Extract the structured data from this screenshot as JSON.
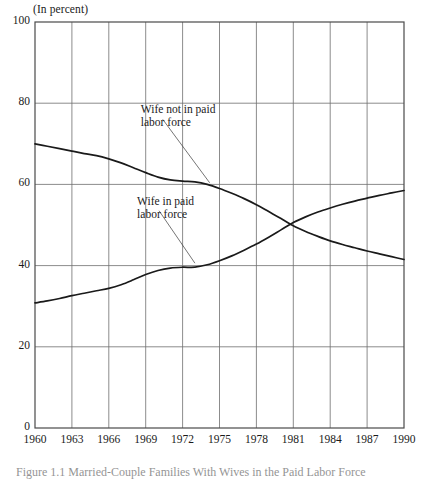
{
  "figure": {
    "unit_label": "(In percent)",
    "caption": "Figure 1.1  Married-Couple Families With Wives in the Paid Labor Force"
  },
  "chart_data": {
    "type": "line",
    "title": "",
    "subtitle": "(In percent)",
    "xlabel": "",
    "ylabel": "(In percent)",
    "xlim": [
      1960,
      1990
    ],
    "ylim": [
      0,
      100
    ],
    "grid": true,
    "legend_position": "inline-annotations",
    "x_ticks": [
      "1960",
      "1963",
      "1966",
      "1969",
      "1972",
      "1975",
      "1978",
      "1981",
      "1984",
      "1987",
      "1990"
    ],
    "y_ticks": [
      "0",
      "20",
      "40",
      "60",
      "80",
      "100"
    ],
    "annotations": [
      {
        "text_line1": "Wife not in paid",
        "text_line2": "labor force",
        "x": 1968.6,
        "y": 76.5,
        "leader_to_x": 1974.2,
        "leader_to_y": 60.4
      },
      {
        "text_line1": "Wife in paid",
        "text_line2": "labor force",
        "x": 1968.3,
        "y": 54.0,
        "leader_to_x": 1973.0,
        "leader_to_y": 40.6
      }
    ],
    "series": [
      {
        "name": "Wife not in paid labor force",
        "color": "#1a1a1a",
        "x": [
          1960,
          1961,
          1962,
          1963,
          1964,
          1965,
          1966,
          1967,
          1968,
          1969,
          1970,
          1971,
          1972,
          1973,
          1974,
          1975,
          1976,
          1977,
          1978,
          1979,
          1980,
          1981,
          1982,
          1983,
          1984,
          1985,
          1986,
          1987,
          1988,
          1989,
          1990
        ],
        "values": [
          70.0,
          69.4,
          68.8,
          68.2,
          67.6,
          67.1,
          66.3,
          65.3,
          64.1,
          62.9,
          61.8,
          61.1,
          60.8,
          60.6,
          60.0,
          59.0,
          57.8,
          56.5,
          55.0,
          53.3,
          51.6,
          49.8,
          48.4,
          47.2,
          46.1,
          45.2,
          44.4,
          43.6,
          42.9,
          42.2,
          41.5
        ]
      },
      {
        "name": "Wife in paid labor force",
        "color": "#1a1a1a",
        "x": [
          1960,
          1961,
          1962,
          1963,
          1964,
          1965,
          1966,
          1967,
          1968,
          1969,
          1970,
          1971,
          1972,
          1973,
          1974,
          1975,
          1976,
          1977,
          1978,
          1979,
          1980,
          1981,
          1982,
          1983,
          1984,
          1985,
          1986,
          1987,
          1988,
          1989,
          1990
        ],
        "values": [
          30.8,
          31.3,
          31.9,
          32.6,
          33.2,
          33.8,
          34.4,
          35.3,
          36.5,
          37.8,
          38.8,
          39.4,
          39.6,
          39.6,
          40.2,
          41.2,
          42.4,
          43.8,
          45.3,
          47.0,
          48.8,
          50.6,
          52.0,
          53.2,
          54.2,
          55.1,
          55.9,
          56.6,
          57.3,
          57.9,
          58.5
        ]
      }
    ]
  }
}
